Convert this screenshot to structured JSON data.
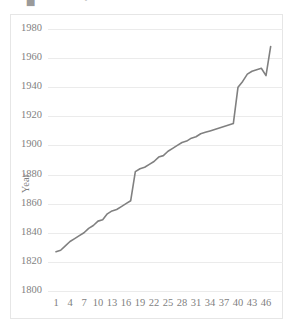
{
  "top_fragments": [
    {
      "text": "▀▄"
    },
    {
      "text": "•"
    }
  ],
  "colors": {
    "line": "#808080",
    "gridline": "#ebebeb",
    "border": "#e6e6e6",
    "text": "#7f7f7f",
    "background": "#ffffff"
  },
  "chart_data": {
    "type": "line",
    "title": "",
    "subtitle": "",
    "xlabel": "",
    "ylabel": "Year",
    "grid": "horizontal",
    "legend": "none",
    "ylim": [
      1800,
      1980
    ],
    "yticks": [
      1800,
      1820,
      1840,
      1860,
      1880,
      1900,
      1920,
      1940,
      1960,
      1980
    ],
    "ytick_labels": [
      "1800",
      "1820",
      "1840",
      "1860",
      "1880",
      "1900",
      "1920",
      "1940",
      "1960",
      "1980"
    ],
    "xlim": [
      1,
      47
    ],
    "xticks": [
      1,
      4,
      7,
      10,
      13,
      16,
      19,
      22,
      25,
      28,
      31,
      34,
      37,
      40,
      43,
      46
    ],
    "xtick_labels": [
      "1",
      "4",
      "7",
      "10",
      "13",
      "16",
      "19",
      "22",
      "25",
      "28",
      "31",
      "34",
      "37",
      "40",
      "43",
      "46"
    ],
    "x": [
      1,
      2,
      3,
      4,
      5,
      6,
      7,
      8,
      9,
      10,
      11,
      12,
      13,
      14,
      15,
      16,
      17,
      18,
      19,
      20,
      21,
      22,
      23,
      24,
      25,
      26,
      27,
      28,
      29,
      30,
      31,
      32,
      33,
      34,
      35,
      36,
      37,
      38,
      39,
      40,
      41,
      42,
      43,
      44,
      45,
      46,
      47
    ],
    "values": [
      1827,
      1828,
      1831,
      1834,
      1836,
      1838,
      1840,
      1843,
      1845,
      1848,
      1849,
      1853,
      1855,
      1856,
      1858,
      1860,
      1862,
      1882,
      1884,
      1885,
      1887,
      1889,
      1892,
      1893,
      1896,
      1898,
      1900,
      1902,
      1903,
      1905,
      1906,
      1908,
      1909,
      1910,
      1911,
      1912,
      1913,
      1914,
      1915,
      1940,
      1944,
      1949,
      1951,
      1952,
      1953,
      1948,
      1968
    ],
    "series": [
      {
        "name": "Year",
        "values": [
          1827,
          1828,
          1831,
          1834,
          1836,
          1838,
          1840,
          1843,
          1845,
          1848,
          1849,
          1853,
          1855,
          1856,
          1858,
          1860,
          1862,
          1882,
          1884,
          1885,
          1887,
          1889,
          1892,
          1893,
          1896,
          1898,
          1900,
          1902,
          1903,
          1905,
          1906,
          1908,
          1909,
          1910,
          1911,
          1912,
          1913,
          1914,
          1915,
          1940,
          1944,
          1949,
          1951,
          1952,
          1953,
          1948,
          1968
        ]
      }
    ]
  }
}
